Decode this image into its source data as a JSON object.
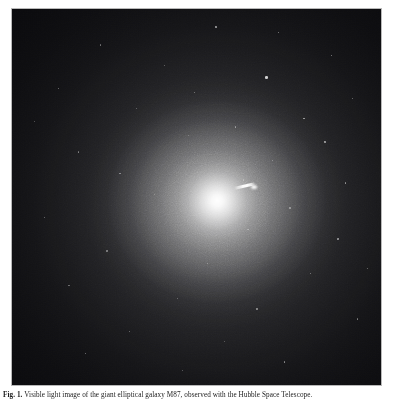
{
  "figure": {
    "caption_label": "Fig. 1.",
    "caption_text": "Visible light image of the giant elliptical galaxy M87, observed with the Hubble Space Telescope.",
    "plate": {
      "object_name": "M87",
      "object_type": "giant elliptical galaxy",
      "features": {
        "nucleus_label": "bright nucleus",
        "jet_label": "relativistic jet",
        "halo_label": "diffuse stellar halo",
        "background_label": "dark sky background"
      },
      "colors": {
        "background": "#07070a",
        "halo": "#3c3c3e",
        "core": "#ffffff",
        "jet": "#ffffff",
        "border": "#b9b9b9",
        "page": "#ffffff"
      },
      "geometry": {
        "core_x_pct": 55.6,
        "core_y_pct": 51.0,
        "jet_position_angle_deg": -13
      }
    },
    "stars": [
      {
        "x": 55.1,
        "y": 4.6,
        "r": 0.8,
        "a": 0.55
      },
      {
        "x": 72.0,
        "y": 6.1,
        "r": 0.7,
        "a": 0.45
      },
      {
        "x": 23.8,
        "y": 9.4,
        "r": 0.7,
        "a": 0.4
      },
      {
        "x": 86.4,
        "y": 12.2,
        "r": 0.8,
        "a": 0.5
      },
      {
        "x": 41.2,
        "y": 14.8,
        "r": 0.6,
        "a": 0.35
      },
      {
        "x": 68.6,
        "y": 17.9,
        "r": 1.3,
        "a": 0.78
      },
      {
        "x": 12.4,
        "y": 21.0,
        "r": 0.7,
        "a": 0.42
      },
      {
        "x": 92.1,
        "y": 23.6,
        "r": 0.7,
        "a": 0.4
      },
      {
        "x": 33.5,
        "y": 26.4,
        "r": 0.6,
        "a": 0.34
      },
      {
        "x": 78.9,
        "y": 28.9,
        "r": 0.9,
        "a": 0.56
      },
      {
        "x": 60.3,
        "y": 31.2,
        "r": 0.7,
        "a": 0.44
      },
      {
        "x": 47.7,
        "y": 33.5,
        "r": 0.6,
        "a": 0.33
      },
      {
        "x": 84.6,
        "y": 35.1,
        "r": 1.0,
        "a": 0.62
      },
      {
        "x": 17.9,
        "y": 37.8,
        "r": 0.7,
        "a": 0.4
      },
      {
        "x": 70.4,
        "y": 40.2,
        "r": 0.6,
        "a": 0.36
      },
      {
        "x": 29.1,
        "y": 43.6,
        "r": 0.7,
        "a": 0.42
      },
      {
        "x": 90.2,
        "y": 46.0,
        "r": 0.8,
        "a": 0.48
      },
      {
        "x": 38.4,
        "y": 49.1,
        "r": 0.6,
        "a": 0.32
      },
      {
        "x": 75.2,
        "y": 52.7,
        "r": 0.7,
        "a": 0.4
      },
      {
        "x": 8.6,
        "y": 55.3,
        "r": 0.7,
        "a": 0.38
      },
      {
        "x": 63.8,
        "y": 58.4,
        "r": 0.6,
        "a": 0.34
      },
      {
        "x": 88.1,
        "y": 61.0,
        "r": 0.8,
        "a": 0.5
      },
      {
        "x": 25.6,
        "y": 64.2,
        "r": 0.7,
        "a": 0.4
      },
      {
        "x": 52.9,
        "y": 67.5,
        "r": 0.6,
        "a": 0.33
      },
      {
        "x": 80.7,
        "y": 70.1,
        "r": 0.7,
        "a": 0.42
      },
      {
        "x": 15.3,
        "y": 73.4,
        "r": 0.7,
        "a": 0.38
      },
      {
        "x": 44.8,
        "y": 76.8,
        "r": 0.6,
        "a": 0.31
      },
      {
        "x": 66.2,
        "y": 79.5,
        "r": 0.8,
        "a": 0.46
      },
      {
        "x": 93.4,
        "y": 82.3,
        "r": 0.7,
        "a": 0.4
      },
      {
        "x": 31.7,
        "y": 85.6,
        "r": 0.7,
        "a": 0.39
      },
      {
        "x": 57.4,
        "y": 88.2,
        "r": 0.6,
        "a": 0.32
      },
      {
        "x": 19.8,
        "y": 91.4,
        "r": 0.7,
        "a": 0.41
      },
      {
        "x": 73.6,
        "y": 93.7,
        "r": 0.8,
        "a": 0.47
      },
      {
        "x": 46.1,
        "y": 95.9,
        "r": 0.6,
        "a": 0.33
      },
      {
        "x": 5.9,
        "y": 29.7,
        "r": 0.6,
        "a": 0.3
      },
      {
        "x": 96.2,
        "y": 68.8,
        "r": 0.7,
        "a": 0.38
      },
      {
        "x": 62.5,
        "y": 45.3,
        "r": 0.6,
        "a": 0.3
      },
      {
        "x": 49.3,
        "y": 22.1,
        "r": 0.7,
        "a": 0.4
      }
    ]
  }
}
